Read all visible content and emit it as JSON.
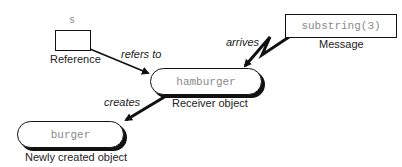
{
  "diagram": {
    "reference": {
      "variable_name": "s",
      "caption": "Reference"
    },
    "message": {
      "text": "substring(3)",
      "caption": "Message"
    },
    "receiver": {
      "text": "hamburger",
      "caption": "Receiver object"
    },
    "result": {
      "text": "burger",
      "caption": "Newly created object"
    },
    "edges": {
      "refers_to": "refers to",
      "arrives": "arrives",
      "creates": "creates"
    },
    "colors": {
      "stroke": "#111111",
      "code_text": "#8a8a8a",
      "label_text": "#222222",
      "background": "#ffffff"
    }
  }
}
